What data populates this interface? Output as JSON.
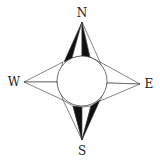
{
  "diagram": {
    "type": "compass-rose",
    "labels": {
      "north": "N",
      "south": "S",
      "east": "E",
      "west": "W"
    },
    "colors": {
      "stroke": "#333333",
      "fill_dark": "#111111",
      "background": "#ffffff"
    }
  }
}
